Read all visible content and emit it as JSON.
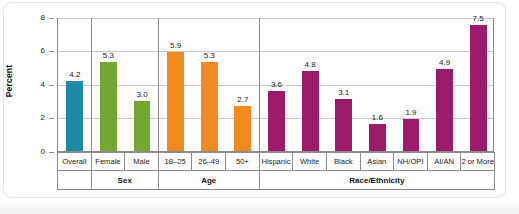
{
  "chart_data": {
    "type": "bar",
    "title": "",
    "xlabel": "",
    "ylabel": "Percent",
    "ylim": [
      0,
      8
    ],
    "yticks": [
      "0",
      "2",
      "4",
      "6",
      "8"
    ],
    "grid": true,
    "legend": "none",
    "categories": [
      "Overall",
      "Female",
      "Male",
      "18–25",
      "26–49",
      "50+",
      "Hispanic",
      "White",
      "Black",
      "Asian",
      "NH/OPI",
      "AI/AN",
      "2 or More"
    ],
    "values": [
      4.2,
      5.3,
      3.0,
      5.9,
      5.3,
      2.7,
      3.6,
      4.8,
      3.1,
      1.6,
      1.9,
      4.9,
      7.5
    ],
    "value_labels": [
      "4.2",
      "5.3",
      "3.0",
      "5.9",
      "5.3",
      "2.7",
      "3.6",
      "4.8",
      "3.1",
      "1.6",
      "1.9",
      "4.9",
      "7.5"
    ],
    "groups": [
      {
        "label": "",
        "span": 1,
        "color": "#2189a8"
      },
      {
        "label": "Sex",
        "span": 2,
        "color": "#72a832"
      },
      {
        "label": "Age",
        "span": 3,
        "color": "#f18a21"
      },
      {
        "label": "Race/Ethnicity",
        "span": 7,
        "color": "#9e1b6b"
      }
    ],
    "colors": {
      "overall": "#2189a8",
      "sex": "#72a832",
      "age": "#f18a21",
      "race": "#9e1b6b",
      "axis": "#8c8c8c",
      "grid": "#c9c9c9",
      "frame": "#e2e2e2"
    }
  }
}
